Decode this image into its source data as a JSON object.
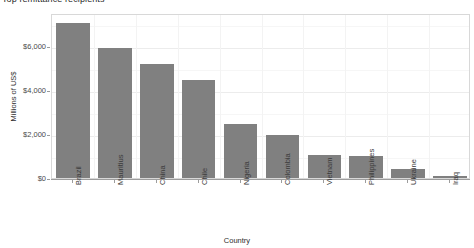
{
  "title": {
    "clipped_text": "Top remittance recipients"
  },
  "axes": {
    "ylabel": "Millions of US$",
    "xlabel": "Country",
    "y_ticks": [
      "$0",
      "$2,000",
      "$4,000",
      "$6,000"
    ]
  },
  "chart_data": {
    "type": "bar",
    "title": "",
    "xlabel": "Country",
    "ylabel": "Millions of US$",
    "ylim": [
      0,
      7500
    ],
    "ytick_values": [
      0,
      2000,
      4000,
      6000
    ],
    "ytick_labels": [
      "$0",
      "$2,000",
      "$4,000",
      "$6,000"
    ],
    "grid": true,
    "legend": false,
    "bar_color": "#808080",
    "panel_background": "#ffffff",
    "gridline_color": "#ececec",
    "categories": [
      "Brazil",
      "Mauritius",
      "China",
      "Chile",
      "Nigeria",
      "Colombia",
      "Vietnam",
      "Philippines",
      "Ukraine",
      "Iraq"
    ],
    "values": [
      7050,
      5900,
      5180,
      4450,
      2450,
      1950,
      1050,
      1000,
      420,
      110
    ]
  }
}
